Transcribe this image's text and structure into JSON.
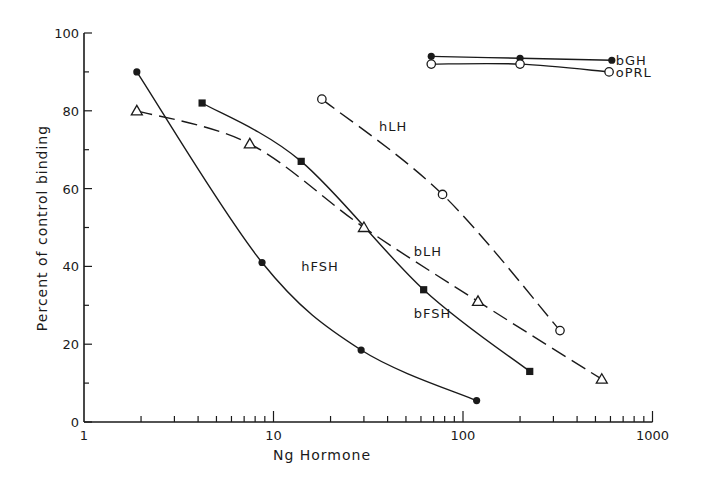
{
  "chart_data": {
    "type": "line",
    "title": "",
    "xlabel": "Ng Hormone",
    "ylabel": "Percent of control binding",
    "xscale": "log",
    "xlim": [
      1,
      1000
    ],
    "ylim": [
      0,
      100
    ],
    "x_ticks": [
      "1",
      "10",
      "100",
      "1000"
    ],
    "y_ticks": [
      "0",
      "20",
      "40",
      "60",
      "80",
      "100"
    ],
    "grid": false,
    "legend": "inline labels",
    "series": [
      {
        "name": "hFSH",
        "marker": "filled-circle",
        "line": "solid",
        "x": [
          1.9,
          8.7,
          29,
          118
        ],
        "y": [
          90,
          41,
          18.5,
          5.5
        ]
      },
      {
        "name": "bFSH",
        "marker": "filled-square",
        "line": "solid",
        "x": [
          4.2,
          14,
          62,
          225
        ],
        "y": [
          82,
          67,
          34,
          13
        ]
      },
      {
        "name": "bLH",
        "marker": "open-triangle",
        "line": "dashed",
        "x": [
          1.9,
          7.5,
          30,
          120,
          540
        ],
        "y": [
          80,
          71.5,
          50,
          31,
          11
        ]
      },
      {
        "name": "hLH",
        "marker": "open-circle",
        "line": "dashed",
        "x": [
          18,
          78,
          325
        ],
        "y": [
          83,
          58.5,
          23.5
        ]
      },
      {
        "name": "bGH",
        "marker": "filled-circle",
        "line": "solid",
        "x": [
          68,
          200,
          610
        ],
        "y": [
          94,
          93.5,
          93
        ]
      },
      {
        "name": "oPRL",
        "marker": "open-circle",
        "line": "solid",
        "x": [
          68,
          200,
          590
        ],
        "y": [
          92,
          92,
          90
        ]
      }
    ],
    "annotations": [
      {
        "text": "hLH",
        "x": 36,
        "y": 76
      },
      {
        "text": "bLH",
        "x": 55,
        "y": 44
      },
      {
        "text": "hFSH",
        "x": 14,
        "y": 40
      },
      {
        "text": "bFSH",
        "x": 55,
        "y": 28
      },
      {
        "text": "bGH",
        "x": 640,
        "y": 93
      },
      {
        "text": "oPRL",
        "x": 640,
        "y": 90
      }
    ]
  }
}
